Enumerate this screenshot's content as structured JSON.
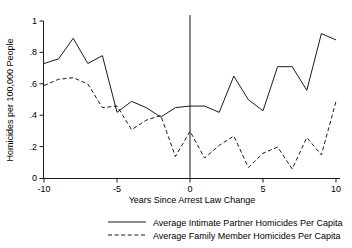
{
  "chart_data": {
    "type": "line",
    "title": "",
    "subtitle": "",
    "xlabel": "Years Since Arrest Law Change",
    "ylabel": "Homicides per 100,000 People",
    "xlim": [
      -10,
      10
    ],
    "ylim": [
      0,
      1
    ],
    "grid": false,
    "legend_position": "bottom",
    "x": [
      -10,
      -9,
      -8,
      -7,
      -6,
      -5,
      -4,
      -3,
      -2,
      -1,
      0,
      1,
      2,
      3,
      4,
      5,
      6,
      7,
      8,
      9,
      10
    ],
    "xticks": [
      -10,
      -5,
      0,
      5,
      10
    ],
    "xtick_labels": [
      "-10",
      "-5",
      "0",
      "5",
      "10"
    ],
    "yticks": [
      0,
      0.2,
      0.4,
      0.6,
      0.8,
      1
    ],
    "ytick_labels": [
      "0",
      ".2",
      ".4",
      ".6",
      ".8",
      "1"
    ],
    "annotations": [
      {
        "name": "policy-reference-line",
        "type": "vline",
        "x": 0,
        "label": ""
      }
    ],
    "series": [
      {
        "name": "Average Intimate Partner Homicides Per Capita",
        "style": "solid",
        "color": "#000000",
        "values": [
          0.73,
          0.76,
          0.89,
          0.73,
          0.78,
          0.42,
          0.49,
          0.45,
          0.39,
          0.45,
          0.46,
          0.46,
          0.42,
          0.65,
          0.5,
          0.43,
          0.71,
          0.71,
          0.56,
          0.92,
          0.88
        ]
      },
      {
        "name": "Average Family Member Homicides Per Capita",
        "style": "dashed",
        "color": "#000000",
        "values": [
          0.59,
          0.63,
          0.64,
          0.6,
          0.45,
          0.46,
          0.31,
          0.37,
          0.4,
          0.14,
          0.3,
          0.13,
          0.21,
          0.27,
          0.07,
          0.16,
          0.2,
          0.06,
          0.26,
          0.15,
          0.49
        ]
      }
    ]
  },
  "legend": {
    "items": [
      {
        "label": "Average Intimate Partner Homicides Per Capita",
        "style": "solid"
      },
      {
        "label": "Average Family Member Homicides Per Capita",
        "style": "dashed"
      }
    ]
  },
  "axes": {
    "x_title": "Years Since Arrest Law Change",
    "y_title": "Homicides per 100,000 People",
    "xtick_labels": [
      "-10",
      "-5",
      "0",
      "5",
      "10"
    ],
    "ytick_labels": [
      "1",
      ".8",
      ".6",
      ".4",
      ".2",
      "0"
    ]
  }
}
